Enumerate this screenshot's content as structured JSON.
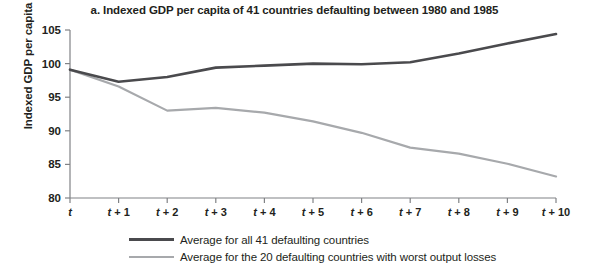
{
  "chart_data": {
    "type": "line",
    "title": "a. Indexed GDP per capita of 41 countries defaulting between 1980 and 1985",
    "xlabel": "",
    "ylabel": "Indexed GDP per capita",
    "x": [
      "t",
      "t + 1",
      "t + 2",
      "t + 3",
      "t + 4",
      "t + 5",
      "t + 6",
      "t + 7",
      "t + 8",
      "t + 9",
      "t + 10"
    ],
    "x_numeric": [
      0,
      1,
      2,
      3,
      4,
      5,
      6,
      7,
      8,
      9,
      10
    ],
    "ylim": [
      80,
      105
    ],
    "xlim": [
      0,
      10
    ],
    "yticks": [
      80,
      85,
      90,
      95,
      100,
      105
    ],
    "ytick_labels": [
      "80",
      "85",
      "90",
      "95",
      "100",
      "105"
    ],
    "grid": false,
    "legend_position": "bottom",
    "series": [
      {
        "name": "Average for all 41 defaulting countries",
        "color": "#4a4a4d",
        "values": [
          99.1,
          97.3,
          98.0,
          99.4,
          99.7,
          100.0,
          99.9,
          100.2,
          101.5,
          103.0,
          104.4
        ]
      },
      {
        "name": "Average for the 20 defaulting countries with worst output losses",
        "color": "#a7a9ac",
        "values": [
          99.1,
          96.6,
          93.0,
          93.4,
          92.7,
          91.4,
          89.7,
          87.5,
          86.6,
          85.1,
          83.2
        ]
      }
    ]
  },
  "legend": {
    "items": [
      {
        "label": "Average for all 41 defaulting countries",
        "color": "#4a4a4d"
      },
      {
        "label": "Average for the 20 defaulting countries with worst output losses",
        "color": "#a7a9ac"
      }
    ]
  }
}
